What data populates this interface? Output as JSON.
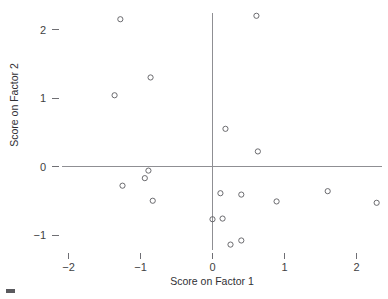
{
  "chart_data": {
    "type": "scatter",
    "title": "",
    "xlabel": "Score on Factor 1",
    "ylabel": "Score on Factor 2",
    "xlim": [
      -2.4,
      2.55
    ],
    "ylim": [
      -1.35,
      2.3
    ],
    "xticks": [
      -2,
      -1,
      0,
      1,
      2
    ],
    "xtick_labels": [
      "−2",
      "−1",
      "0",
      "1",
      "2"
    ],
    "yticks": [
      -1,
      0,
      1,
      2
    ],
    "ytick_labels": [
      "−1",
      "0",
      "1",
      "2"
    ],
    "grid": false,
    "legend": null,
    "marker": "open-circle",
    "series": [
      {
        "name": "observations",
        "points": [
          [
            -1.28,
            2.15
          ],
          [
            0.61,
            2.2
          ],
          [
            -0.86,
            1.3
          ],
          [
            -1.36,
            1.04
          ],
          [
            0.18,
            0.55
          ],
          [
            0.63,
            0.22
          ],
          [
            -0.89,
            -0.06
          ],
          [
            -0.94,
            -0.17
          ],
          [
            -1.25,
            -0.28
          ],
          [
            -0.83,
            -0.5
          ],
          [
            0.11,
            -0.39
          ],
          [
            0.4,
            -0.41
          ],
          [
            0.89,
            -0.51
          ],
          [
            1.6,
            -0.36
          ],
          [
            2.28,
            -0.53
          ],
          [
            0.0,
            -0.77
          ],
          [
            0.14,
            -0.76
          ],
          [
            0.25,
            -1.14
          ],
          [
            0.4,
            -1.08
          ]
        ]
      }
    ]
  },
  "axes": {
    "x_axis_label": "Score on Factor 1",
    "y_axis_label": "Score on Factor 2"
  }
}
